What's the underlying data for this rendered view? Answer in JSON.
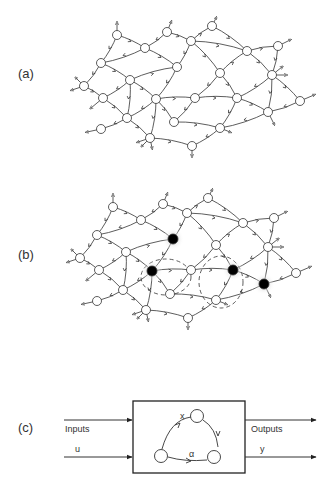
{
  "figure": {
    "panels": [
      {
        "id": "a",
        "label": "(a)",
        "description": "Directed network of nodes with arrowed edges"
      },
      {
        "id": "b",
        "label": "(b)",
        "description": "Same network with four highlighted (black) nodes and dashed loops"
      },
      {
        "id": "c",
        "label": "(c)",
        "description": "System block with inputs and outputs"
      }
    ],
    "network": {
      "nodes": [
        [
          117,
          35
        ],
        [
          167,
          32
        ],
        [
          212,
          26
        ],
        [
          145,
          48
        ],
        [
          191,
          41
        ],
        [
          247,
          51
        ],
        [
          278,
          46
        ],
        [
          101,
          63
        ],
        [
          177,
          67
        ],
        [
          220,
          73
        ],
        [
          272,
          75
        ],
        [
          84,
          86
        ],
        [
          130,
          80
        ],
        [
          103,
          98
        ],
        [
          156,
          99
        ],
        [
          195,
          98
        ],
        [
          237,
          98
        ],
        [
          300,
          101
        ],
        [
          127,
          118
        ],
        [
          174,
          122
        ],
        [
          268,
          112
        ],
        [
          220,
          128
        ],
        [
          101,
          129
        ],
        [
          150,
          138
        ],
        [
          192,
          146
        ]
      ],
      "highlighted_nodes_b": [
        8,
        14,
        16,
        20
      ]
    },
    "block": {
      "inputs_label": "Inputs",
      "input_symbol": "u",
      "outputs_label": "Outputs",
      "output_symbol": "y",
      "state_symbol": "x",
      "param_symbol": "α"
    },
    "colors": {
      "stroke": "#333333",
      "node_fill": "#ffffff",
      "highlight_fill": "#000000",
      "halo": "#cccccc"
    }
  }
}
